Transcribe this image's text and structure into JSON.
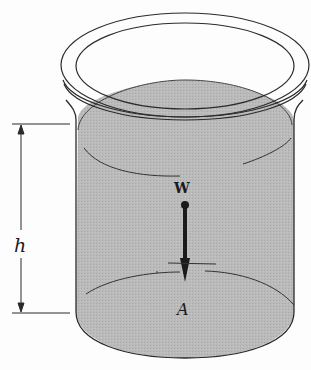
{
  "diagram": {
    "type": "physics-figure",
    "labels": {
      "height": "h",
      "weight": "W",
      "area": "A"
    },
    "colors": {
      "liquid": "#b9b9b9",
      "outline": "#2b2b2b",
      "background": "#fdfdfd"
    }
  }
}
